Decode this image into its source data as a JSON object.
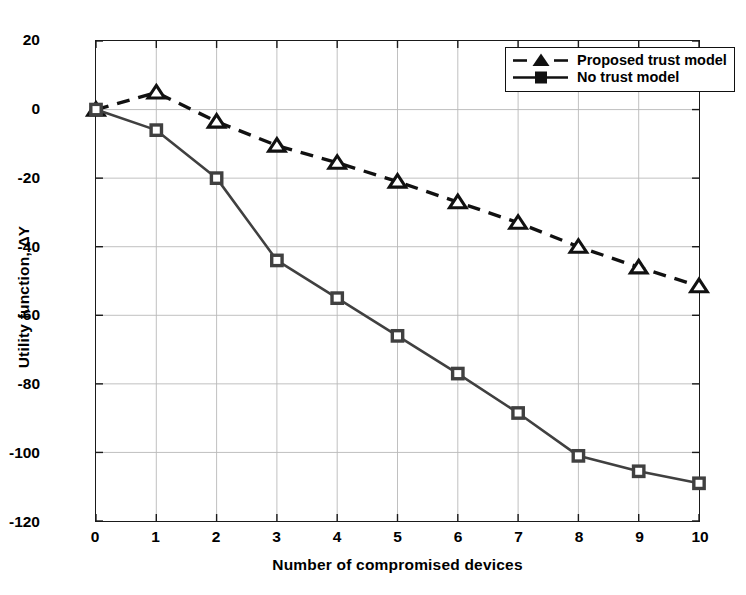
{
  "chart_data": {
    "type": "line",
    "title": "",
    "xlabel": "Number of compromised devices",
    "ylabel": "Utility function, ΔY",
    "x": [
      0,
      1,
      2,
      3,
      4,
      5,
      6,
      7,
      8,
      9,
      10
    ],
    "xlim": [
      0,
      10
    ],
    "ylim": [
      -120,
      20
    ],
    "xticks": [
      "0",
      "1",
      "2",
      "3",
      "4",
      "5",
      "6",
      "7",
      "8",
      "9",
      "10"
    ],
    "yticks": [
      "20",
      "0",
      "-20",
      "-40",
      "-60",
      "-80",
      "-100",
      "-120"
    ],
    "ytick_values": [
      20,
      0,
      -20,
      -40,
      -60,
      -80,
      -100,
      -120
    ],
    "grid": true,
    "legend_position": "top-right",
    "series": [
      {
        "name": "Proposed trust model",
        "marker": "triangle",
        "linestyle": "dashed",
        "color": "#111111",
        "values": [
          0,
          5,
          -3.5,
          -10.5,
          -15.5,
          -21,
          -27,
          -33,
          -40,
          -46,
          -51.5
        ]
      },
      {
        "name": "No trust model",
        "marker": "square",
        "linestyle": "solid",
        "color": "#404040",
        "values": [
          0,
          -6,
          -20,
          -44,
          -55,
          -66,
          -77,
          -88.5,
          -101,
          -105.5,
          -109
        ]
      }
    ]
  },
  "legend": {
    "items": [
      {
        "label": "Proposed trust model"
      },
      {
        "label": "No trust model"
      }
    ]
  }
}
